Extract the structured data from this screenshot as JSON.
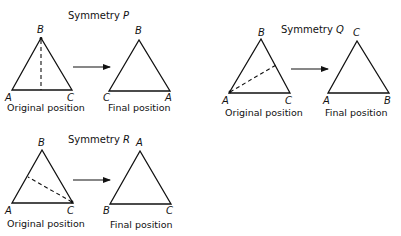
{
  "figure": {
    "caption_original": "Original position",
    "caption_final": "Final position",
    "symmetries": [
      {
        "id": "P",
        "title_prefix": "Symmetry",
        "title_letter": "P",
        "axis_description": "dashed line from vertex B perpendicular to side AC",
        "original": {
          "top": "B",
          "left": "A",
          "right": "C"
        },
        "final": {
          "top": "B",
          "left": "C",
          "right": "A"
        }
      },
      {
        "id": "Q",
        "title_prefix": "Symmetry",
        "title_letter": "Q",
        "axis_description": "dashed line from vertex A to midpoint of side BC",
        "original": {
          "top": "B",
          "left": "A",
          "right": "C"
        },
        "final": {
          "top": "C",
          "left": "A",
          "right": "B"
        }
      },
      {
        "id": "R",
        "title_prefix": "Symmetry",
        "title_letter": "R",
        "axis_description": "dashed line from vertex C to midpoint of side AB",
        "original": {
          "top": "B",
          "left": "A",
          "right": "C"
        },
        "final": {
          "top": "A",
          "left": "B",
          "right": "C"
        }
      }
    ]
  }
}
